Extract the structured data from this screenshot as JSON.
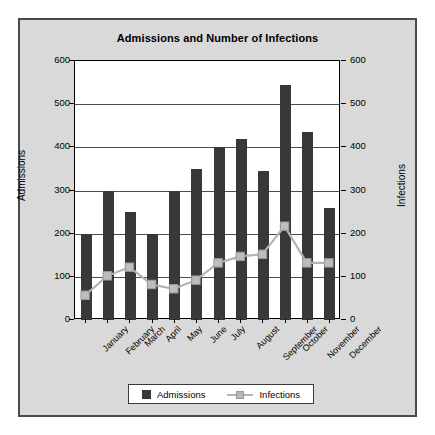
{
  "chart_data": {
    "type": "bar",
    "title": "Admissions and Number of Infections",
    "categories": [
      "January",
      "February",
      "March",
      "April",
      "May",
      "June",
      "July",
      "August",
      "September",
      "October",
      "November",
      "December"
    ],
    "series": [
      {
        "name": "Admissions",
        "type": "bar",
        "axis": "left",
        "color": "#383838",
        "values": [
          200,
          300,
          250,
          200,
          300,
          350,
          400,
          420,
          345,
          545,
          435,
          260
        ]
      },
      {
        "name": "Infections",
        "type": "line",
        "axis": "right",
        "color": "#b3b3b3",
        "values": [
          55,
          100,
          120,
          80,
          70,
          90,
          130,
          145,
          150,
          215,
          130,
          130
        ]
      }
    ],
    "xlabel": "",
    "ylabel": "Admissions",
    "y2label": "Infections",
    "ylim": [
      0,
      600
    ],
    "y2lim": [
      0,
      600
    ],
    "yticks": [
      0,
      100,
      200,
      300,
      400,
      500,
      600
    ],
    "y2ticks": [
      0,
      100,
      200,
      300,
      400,
      500,
      600
    ],
    "grid": true,
    "legend_position": "bottom"
  },
  "legend": {
    "admissions_label": "Admissions",
    "infections_label": "Infections"
  }
}
